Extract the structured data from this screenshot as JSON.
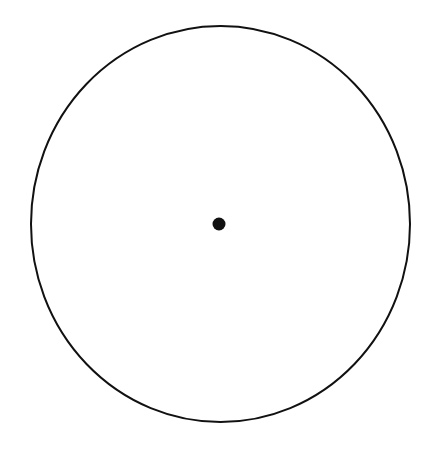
{
  "diagram": {
    "title": "",
    "shapes": [
      {
        "type": "circle",
        "cx": 220,
        "cy": 224,
        "r": 189.5,
        "stroke": "#111111",
        "stroke_width": 2,
        "fill": "none",
        "label": "circle-outline"
      },
      {
        "type": "point",
        "cx": 219,
        "cy": 224,
        "r": 6.5,
        "fill": "#111111",
        "label": "center-point"
      }
    ]
  },
  "colors": {
    "background": "#ffffff",
    "stroke": "#111111"
  }
}
